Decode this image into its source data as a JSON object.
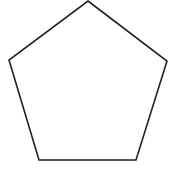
{
  "diagram": {
    "type": "polygon",
    "shape": "regular-pentagon",
    "sides": 5,
    "vertices": [
      {
        "name": "top",
        "x": 88,
        "y": 1
      },
      {
        "name": "right",
        "x": 167,
        "y": 61
      },
      {
        "name": "bottom-right",
        "x": 136,
        "y": 160
      },
      {
        "name": "bottom-left",
        "x": 39,
        "y": 160
      },
      {
        "name": "left",
        "x": 9,
        "y": 60
      }
    ],
    "stroke_color": "#222222",
    "stroke_width": 1.6,
    "fill_color": "#ffffff",
    "background": "#ffffff"
  }
}
